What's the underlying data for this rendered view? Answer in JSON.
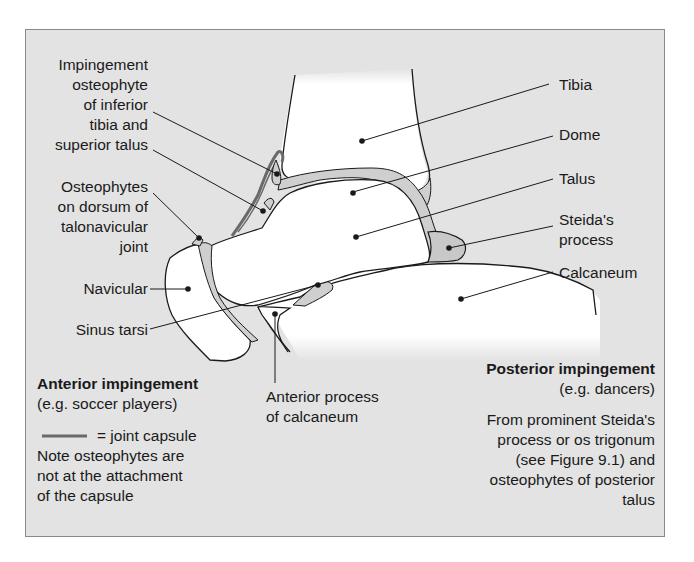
{
  "diagram": {
    "left_labels": {
      "impingement": [
        "Impingement",
        "osteophyte",
        "of inferior",
        "tibia and",
        "superior talus"
      ],
      "osteophytes": [
        "Osteophytes",
        "on dorsum of",
        "talonavicular",
        "joint"
      ],
      "navicular": "Navicular",
      "sinus_tarsi": "Sinus tarsi"
    },
    "right_labels": {
      "tibia": "Tibia",
      "dome": "Dome",
      "talus": "Talus",
      "steida": [
        "Steida's",
        "process"
      ],
      "calcaneum": "Calcaneum"
    },
    "bottom_labels": {
      "anterior_process": [
        "Anterior process",
        "of calcaneum"
      ]
    },
    "anterior_block": {
      "title": "Anterior impingement",
      "subtitle": "(e.g. soccer players)",
      "legend_text": "= joint capsule",
      "note": [
        "Note osteophytes are",
        "not at the attachment",
        "of the capsule"
      ]
    },
    "posterior_block": {
      "title": "Posterior impingement",
      "subtitle": "(e.g. dancers)",
      "note": [
        "From prominent Steida's",
        "process or os trigonum",
        "(see Figure 9.1) and",
        "osteophytes of posterior",
        "talus"
      ]
    },
    "colors": {
      "background": "#e3e3e3",
      "bone": "#ffffff",
      "cartilage": "#cfcfcf",
      "capsule": "#6a6a6a",
      "outline": "#1a1a1a"
    }
  }
}
